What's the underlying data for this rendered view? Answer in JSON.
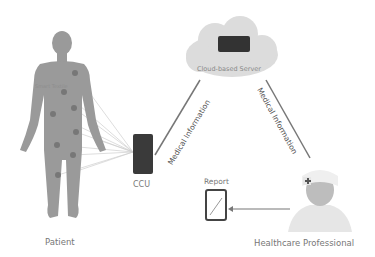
{
  "diagram": {
    "nodes": {
      "patient": {
        "label": "Patient",
        "sensor_label": "Smart Textile"
      },
      "ccu": {
        "label": "CCU"
      },
      "cloud": {
        "label": "Cloud-based Server"
      },
      "report": {
        "label": "Report"
      },
      "professional": {
        "label": "Healthcare Professional"
      }
    },
    "edges": {
      "ccu_to_cloud": "Medical Information",
      "cloud_to_professional": "Medical Information"
    },
    "colors": {
      "body": "#9a9a9a",
      "sensor": "#7a7a7a",
      "cloud": "#d9d9d9",
      "server": "#333333",
      "link": "#777777"
    }
  }
}
